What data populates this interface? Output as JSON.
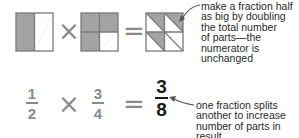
{
  "diagram": {
    "top_row": {
      "squares": [
        {
          "name": "half-square",
          "grid": "2 columns",
          "shaded": "left column"
        },
        {
          "name": "three-quarters-square",
          "grid": "2x2",
          "shaded": "3 of 4 cells"
        },
        {
          "name": "three-eighths-square",
          "grid": "2x2 with diagonals",
          "shaded": "3 of 8 triangles"
        }
      ],
      "operator_multiply": "×",
      "operator_equals": "="
    },
    "bottom_row": {
      "fraction_a": {
        "numerator": "1",
        "denominator": "2"
      },
      "operator_multiply": "×",
      "fraction_b": {
        "numerator": "3",
        "denominator": "4"
      },
      "operator_equals": "=",
      "result": {
        "numerator": "3",
        "denominator": "8"
      }
    },
    "annotations": {
      "top": "make a fraction half\nas big by doubling\nthe total number\nof parts—the\nnumerator is\nunchanged",
      "bottom": "one fraction splits\nanother to increase\nnumber of parts in result"
    },
    "colors": {
      "shade": "#a3a3a3",
      "outline": "#7a7a7a",
      "operator": "#8a8a8a",
      "result": "#1a1a1a",
      "text": "#2a2a2a"
    }
  }
}
